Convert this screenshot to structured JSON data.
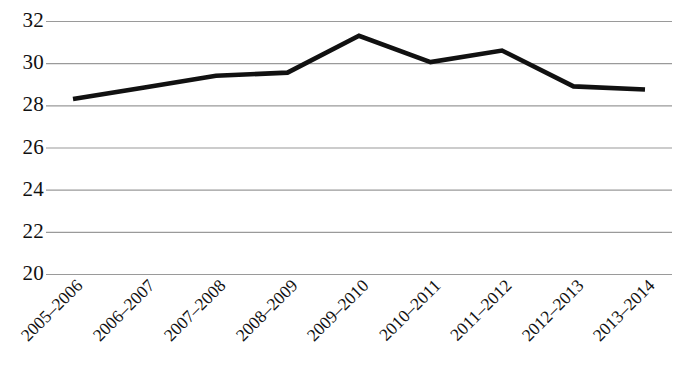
{
  "chart_data": {
    "type": "line",
    "title": "",
    "subtitle": "",
    "xlabel": "",
    "ylabel": "",
    "categories": [
      "2005–2006",
      "2006–2007",
      "2007–2008",
      "2008–2009",
      "2009–2010",
      "2010–2011",
      "2011–2012",
      "2012–2013",
      "2013–2014"
    ],
    "values": [
      28.3,
      28.85,
      29.4,
      29.55,
      31.3,
      30.05,
      30.6,
      28.9,
      28.75
    ],
    "series": [
      {
        "name": "",
        "values": [
          28.3,
          28.85,
          29.4,
          29.55,
          31.3,
          30.05,
          30.6,
          28.9,
          28.75
        ]
      }
    ],
    "ylim": [
      20,
      32
    ],
    "yticks": [
      20,
      22,
      24,
      26,
      28,
      30,
      32
    ],
    "ytick_labels": [
      "20",
      "22",
      "24",
      "26",
      "28",
      "30",
      "32"
    ],
    "grid": true,
    "grid_axis": "y",
    "legend": "none",
    "line_color": "#111111",
    "grid_color": "#9a9a9a",
    "background_color": "#ffffff",
    "xtick_rotation": -45
  }
}
